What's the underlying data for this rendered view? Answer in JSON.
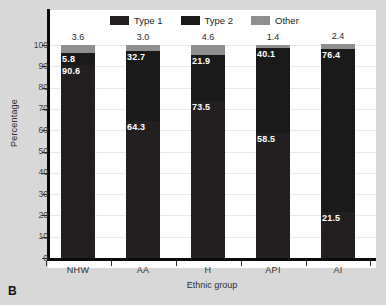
{
  "panel": {
    "letter": "B"
  },
  "legend": {
    "position": "top-center",
    "items": [
      {
        "label": "Type 1",
        "color": "#231f20"
      },
      {
        "label": "Type 2",
        "color": "#1a1a1a"
      },
      {
        "label": "Other",
        "color": "#8f8f8f"
      }
    ]
  },
  "axes": {
    "ylabel": "Percentage",
    "xlabel": "Ethnic group",
    "yticks": [
      0,
      10,
      20,
      30,
      40,
      50,
      60,
      70,
      80,
      90,
      100
    ],
    "ylim": [
      0,
      100
    ],
    "grid": true
  },
  "chart_data": {
    "type": "bar",
    "title": "",
    "subtitle": "",
    "xlabel": "Ethnic group",
    "ylabel": "Percentage",
    "ylim": [
      0,
      100
    ],
    "grid": true,
    "stacked": true,
    "legend_position": "top-center",
    "categories": [
      "NHW",
      "AA",
      "H",
      "API",
      "AI"
    ],
    "series": [
      {
        "name": "Type 1",
        "color": "#231f20",
        "values": [
          90.6,
          64.3,
          73.5,
          58.5,
          21.5
        ]
      },
      {
        "name": "Type 2",
        "color": "#1a1a1a",
        "values": [
          5.8,
          32.7,
          21.9,
          40.1,
          76.4
        ]
      },
      {
        "name": "Other",
        "color": "#8f8f8f",
        "values": [
          3.6,
          3.0,
          4.6,
          1.4,
          2.4
        ]
      }
    ],
    "annotations": {
      "other_above_bar": [
        "3.6",
        "3.0",
        "4.6",
        "1.4",
        "2.4"
      ],
      "type2_in_bar": [
        "5.8",
        "32.7",
        "21.9",
        "40.1",
        "76.4"
      ],
      "type1_in_bar": [
        "90.6",
        "64.3",
        "73.5",
        "58.5",
        "21.5"
      ]
    }
  }
}
